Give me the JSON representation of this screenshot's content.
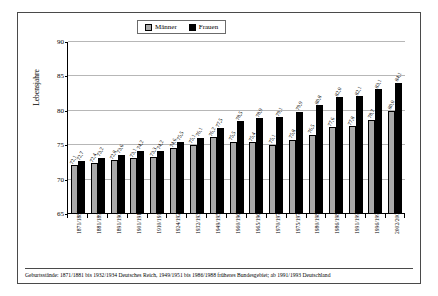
{
  "chart_data": {
    "type": "bar",
    "title": "",
    "xlabel": "",
    "ylabel": "Lebensjahre",
    "ylim": [
      65,
      90
    ],
    "yticks": [
      65,
      70,
      75,
      80,
      85,
      90
    ],
    "grid": true,
    "legend_position": "top-center",
    "categories": [
      "1871/1881",
      "1881/1890",
      "1891/1900",
      "1901/1910",
      "1910/1911",
      "1924/1926",
      "1932/1934",
      "1949/1951",
      "1960/1962",
      "1965/1967",
      "1970/1972",
      "1975/1977",
      "1980/1982",
      "1986/1988",
      "1991/1993",
      "1996/1998",
      "2002/2004"
    ],
    "series": [
      {
        "name": "Männer",
        "color": "#a9a9a9",
        "values": [
          72.1,
          72.4,
          72.8,
          73.1,
          73.3,
          74.6,
          75.1,
          76.2,
          75.5,
          75.4,
          75.1,
          75.8,
          76.5,
          77.6,
          77.8,
          78.7,
          80.0
        ],
        "labels": [
          "72,1",
          "72,4",
          "72,8",
          "73,1",
          "73,3",
          "74,6",
          "75,1",
          "76,2",
          "75,5",
          "75,4",
          "75,1",
          "75,8",
          "76,5",
          "77,6",
          "77,8",
          "78,7",
          "80,0"
        ]
      },
      {
        "name": "Frauen",
        "color": "#000000",
        "values": [
          72.7,
          73.2,
          73.6,
          74.2,
          74.2,
          75.5,
          76.1,
          77.5,
          78.5,
          78.9,
          79.1,
          79.9,
          80.8,
          82.0,
          82.1,
          83.1,
          84.1
        ],
        "labels": [
          "72,7",
          "73,2",
          "73,6",
          "74,2",
          "74,2",
          "75,5",
          "76,1",
          "77,5",
          "78,5",
          "78,9",
          "79,1",
          "79,9",
          "80,8",
          "82,0",
          "82,1",
          "83,1",
          "84,1"
        ]
      }
    ],
    "footnote": "Geburtsstände: 1871/1881 bis 1932/1934 Deutsches Reich, 1949/1951 bis 1986/1988 früheres Bundesgebiet; ab 1991/1993 Deutschland"
  },
  "legend": {
    "men_label": "Männer",
    "women_label": "Frauen"
  },
  "axis": {
    "y_title": "Lebensjahre",
    "y_tick_0": "65",
    "y_tick_1": "70",
    "y_tick_2": "75",
    "y_tick_3": "80",
    "y_tick_4": "85",
    "y_tick_5": "90"
  },
  "footnote": {
    "text": "Geburtsstände: 1871/1881 bis 1932/1934 Deutsches Reich, 1949/1951 bis 1986/1988 früheres Bundesgebiet; ab 1991/1993 Deutschland"
  },
  "colors": {
    "men": "#a9a9a9",
    "women": "#000000",
    "grid": "#b7b7b7",
    "frame": "#4a4a4a"
  }
}
